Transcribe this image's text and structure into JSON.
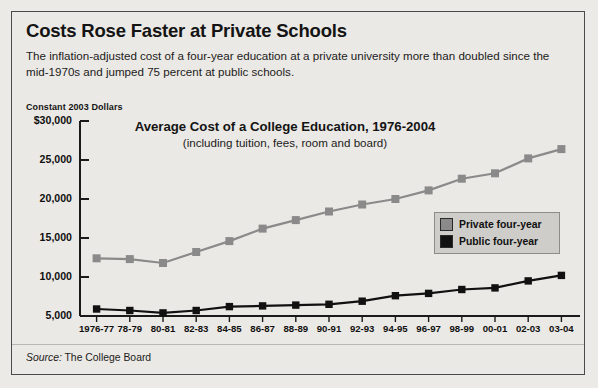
{
  "headline": "Costs Rose Faster at Private Schools",
  "subtitle": "The inflation-adjusted cost of a four-year education at a private university more than doubled since the mid-1970s and jumped 75 percent at public schools.",
  "axis_caption": "Constant 2003 Dollars",
  "source_prefix": "Source:",
  "source_text": " The College Board",
  "legend": {
    "items": [
      {
        "label": "Private four-year",
        "color": "#8a8a8a"
      },
      {
        "label": "Public four-year",
        "color": "#111111"
      }
    ]
  },
  "chart_data": {
    "type": "line",
    "title": "Average Cost of a College Education, 1976-2004",
    "subtitle": "(including tuition, fees, room and board)",
    "xlabel": "",
    "ylabel": "Constant 2003 Dollars",
    "ylim": [
      5000,
      30000
    ],
    "yticks": [
      30000,
      25000,
      20000,
      15000,
      10000,
      5000
    ],
    "ytick_labels": [
      "$30,000",
      "25,000",
      "20,000",
      "15,000",
      "10,000",
      "5,000"
    ],
    "grid": false,
    "legend_position": "right",
    "categories": [
      "1976-77",
      "78-79",
      "80-81",
      "82-83",
      "84-85",
      "86-87",
      "88-89",
      "90-91",
      "92-93",
      "94-95",
      "96-97",
      "98-99",
      "00-01",
      "02-03",
      "03-04"
    ],
    "series": [
      {
        "name": "Private four-year",
        "color": "#8a8a8a",
        "values": [
          12400,
          12300,
          11800,
          13200,
          14600,
          16200,
          17300,
          18400,
          19300,
          20000,
          21100,
          22600,
          23300,
          25200,
          26400
        ]
      },
      {
        "name": "Public four-year",
        "color": "#111111",
        "values": [
          5900,
          5700,
          5400,
          5700,
          6200,
          6300,
          6400,
          6500,
          6900,
          7600,
          7900,
          8400,
          8600,
          9500,
          10200
        ]
      }
    ]
  }
}
